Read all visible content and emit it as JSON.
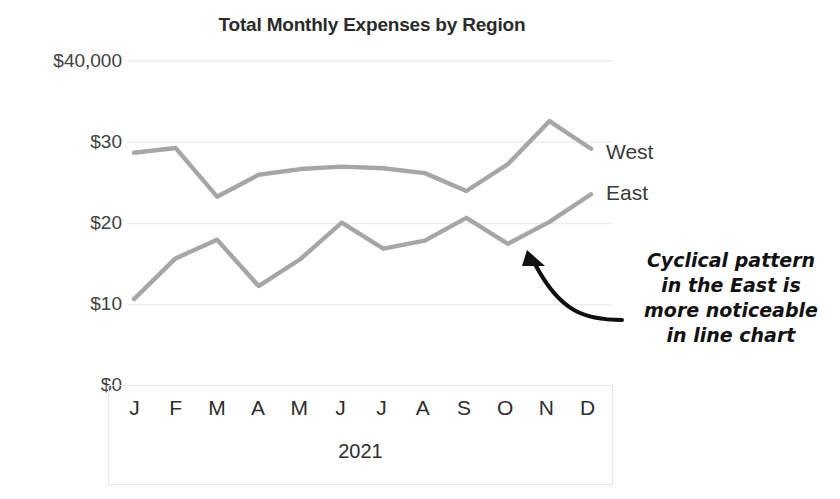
{
  "chart_data": {
    "type": "line",
    "title": "Total Monthly Expenses by Region",
    "xlabel": "2021",
    "ylabel": "",
    "categories": [
      "J",
      "F",
      "M",
      "A",
      "M",
      "J",
      "J",
      "A",
      "S",
      "O",
      "N",
      "D"
    ],
    "category_full": [
      "January",
      "February",
      "March",
      "April",
      "May",
      "June",
      "July",
      "August",
      "September",
      "October",
      "November",
      "December"
    ],
    "series": [
      {
        "name": "West",
        "color": "#a6a6a6",
        "values": [
          28.7,
          29.3,
          23.3,
          26.0,
          26.7,
          27.0,
          26.8,
          26.2,
          24.0,
          27.3,
          32.6,
          29.2
        ]
      },
      {
        "name": "East",
        "color": "#a6a6a6",
        "values": [
          10.7,
          15.7,
          18.0,
          12.3,
          15.6,
          20.1,
          16.9,
          17.9,
          20.7,
          17.5,
          20.2,
          23.6
        ]
      }
    ],
    "ylim": [
      0,
      40
    ],
    "yticks": [
      0,
      10,
      20,
      30,
      40
    ],
    "ytick_labels": [
      "$0",
      "$10",
      "$20",
      "$30",
      "$40,000"
    ],
    "grid": true,
    "legend_position": "right-inline",
    "annotations": [
      {
        "name": "cyclical-pattern-note",
        "lines": [
          "Cyclical pattern",
          "in the East is",
          "more noticeable",
          "in line chart"
        ],
        "arrow_to": "East series October point"
      }
    ]
  },
  "colors": {
    "line": "#a6a6a6",
    "grid": "#ededed",
    "axis_box": "#e2e2e2",
    "text": "#2e2e2e",
    "title": "#2b2b2b",
    "annotation": "#111111"
  }
}
